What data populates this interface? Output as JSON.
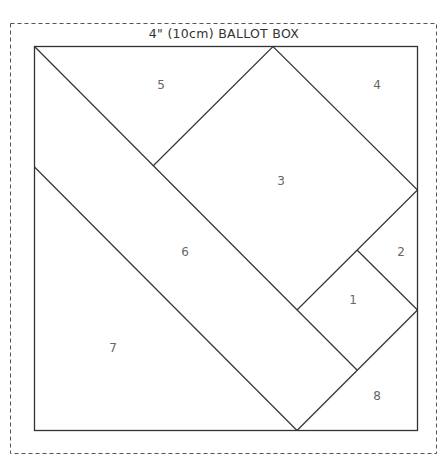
{
  "title": "4\" (10cm) BALLOT BOX",
  "pieces": [
    {
      "label": "1",
      "x": 353,
      "y": 300
    },
    {
      "label": "2",
      "x": 401,
      "y": 252
    },
    {
      "label": "3",
      "x": 281,
      "y": 181
    },
    {
      "label": "4",
      "x": 377,
      "y": 85
    },
    {
      "label": "5",
      "x": 161,
      "y": 85
    },
    {
      "label": "6",
      "x": 185,
      "y": 252
    },
    {
      "label": "7",
      "x": 113,
      "y": 348
    },
    {
      "label": "8",
      "x": 377,
      "y": 396
    }
  ],
  "colors": {
    "line": "#333333",
    "dash": "#555555",
    "text": "#666666"
  }
}
